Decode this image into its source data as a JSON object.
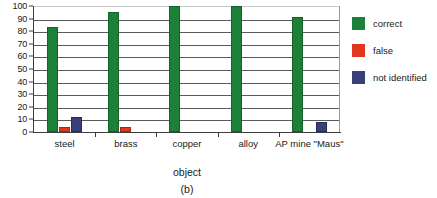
{
  "chart_data": {
    "type": "bar",
    "title": "",
    "subtitle": "",
    "xlabel": "object",
    "ylabel": "",
    "caption": "(b)",
    "ylim": [
      0,
      100
    ],
    "ytick_step": 10,
    "yticks": [
      "100",
      "90",
      "80",
      "70",
      "60",
      "50",
      "40",
      "30",
      "20",
      "10",
      "0"
    ],
    "grid": true,
    "legend_position": "right",
    "categories": [
      "steel",
      "brass",
      "copper",
      "alloy",
      "AP mine \"Maus\""
    ],
    "series": [
      {
        "name": "correct",
        "color": "#1d8038",
        "values": [
          83,
          95,
          100,
          100,
          91
        ]
      },
      {
        "name": "false",
        "color": "#e1371b",
        "values": [
          4,
          4,
          0,
          0,
          0
        ]
      },
      {
        "name": "not identified",
        "color": "#383f79",
        "values": [
          12,
          0,
          0,
          0,
          8
        ]
      }
    ]
  },
  "legend": {
    "items": [
      {
        "label": "correct",
        "color": "#1d8038"
      },
      {
        "label": "false",
        "color": "#e1371b"
      },
      {
        "label": "not identified",
        "color": "#383f79"
      }
    ]
  }
}
